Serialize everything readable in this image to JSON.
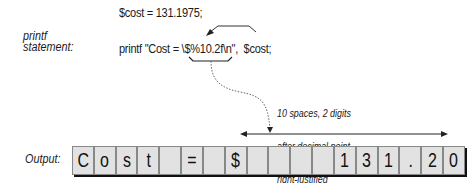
{
  "assignment_line": "$cost = 131.1975;",
  "printf_label": [
    "printf",
    "statement:"
  ],
  "printf_line": "printf \"Cost = \\$%10.2f\\n\",  $cost;",
  "annotation": [
    "10 spaces, 2 digits",
    "after decimal point,",
    "right-justified"
  ],
  "output_label": "Output:",
  "output_cells": [
    "C",
    "o",
    "s",
    "t",
    " ",
    "=",
    " ",
    "$",
    " ",
    " ",
    " ",
    " ",
    "1",
    "3",
    "1",
    ".",
    "2",
    "0"
  ],
  "colors": {
    "cell_fill": "#e2e2e2",
    "cell_border": "#888888",
    "text": "#1a1a1a",
    "shadow": "#111111"
  }
}
